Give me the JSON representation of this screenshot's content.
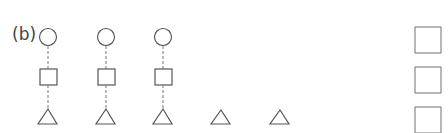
{
  "label": "(b)",
  "colors": {
    "stroke": "#555555",
    "box_stroke": "#777777"
  },
  "columns": [
    {
      "x": 48,
      "circle": true,
      "square": true,
      "triangle": true
    },
    {
      "x": 106,
      "circle": true,
      "square": true,
      "triangle": true
    },
    {
      "x": 163,
      "circle": true,
      "square": true,
      "triangle": true
    },
    {
      "x": 221,
      "circle": false,
      "square": false,
      "triangle": true
    },
    {
      "x": 280,
      "circle": false,
      "square": false,
      "triangle": true
    }
  ],
  "answer_boxes": [
    {
      "label": ""
    },
    {
      "label": ""
    },
    {
      "label": ""
    }
  ]
}
